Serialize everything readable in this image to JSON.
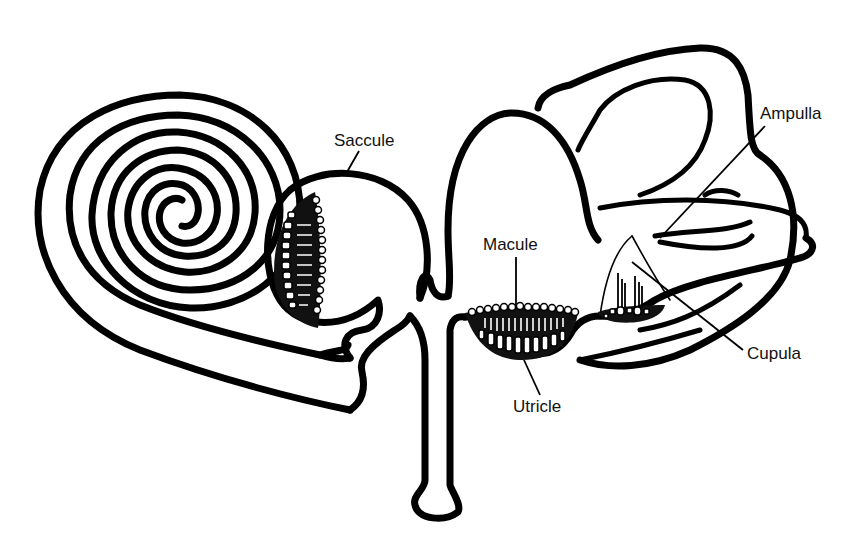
{
  "diagram": {
    "background": "#ffffff",
    "line_color": "#000000",
    "labels": {
      "saccule": "Saccule",
      "ampulla": "Ampulla",
      "macule": "Macule",
      "cupula": "Cupula",
      "utricle": "Utricle"
    },
    "structures": [
      {
        "id": "cochlea",
        "name": "Cochlea (spiral duct)",
        "labeled": false
      },
      {
        "id": "saccule",
        "name": "Saccule",
        "labeled": true
      },
      {
        "id": "endolymphatic-duct",
        "name": "Endolymphatic duct",
        "labeled": false
      },
      {
        "id": "utricle",
        "name": "Utricle",
        "labeled": true
      },
      {
        "id": "macule",
        "name": "Macule",
        "labeled": true
      },
      {
        "id": "semicircular-canals",
        "name": "Semicircular canals",
        "labeled": false
      },
      {
        "id": "ampulla",
        "name": "Ampulla",
        "labeled": true
      },
      {
        "id": "cupula",
        "name": "Cupula",
        "labeled": true
      }
    ]
  }
}
